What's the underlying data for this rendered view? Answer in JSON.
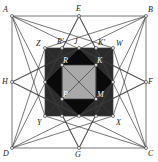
{
  "figure": {
    "type": "geometric-diagram",
    "canvas": {
      "width": 158,
      "height": 162
    },
    "colors": {
      "background": "#ffffff",
      "stroke": "#3c3c3c",
      "outer_square_fill": "#ffffff",
      "mid_square_fill": "#2b2b2b",
      "rotated_square_fill": "#0a0a0a",
      "inner_square_fill": "#a9a9a9",
      "node_fill": "#ffffff",
      "label": "#1a1a1a",
      "label_on_dark": "#ffffff"
    },
    "outer_square": {
      "name": "ABCD",
      "corners": [
        {
          "id": "A",
          "label": "A",
          "x": 12,
          "y": 16,
          "label_x": 3,
          "label_y": 6
        },
        {
          "id": "B",
          "label": "B",
          "x": 146,
          "y": 16,
          "label_x": 148,
          "label_y": 6
        },
        {
          "id": "C",
          "label": "C",
          "x": 146,
          "y": 148,
          "label_x": 148,
          "label_y": 150
        },
        {
          "id": "D",
          "label": "D",
          "x": 12,
          "y": 148,
          "label_x": 3,
          "label_y": 150
        }
      ],
      "midpoints": [
        {
          "id": "E",
          "label": "E",
          "x": 79,
          "y": 16,
          "label_x": 76,
          "label_y": 5
        },
        {
          "id": "F",
          "label": "F",
          "x": 146,
          "y": 82,
          "label_x": 148,
          "label_y": 78
        },
        {
          "id": "G",
          "label": "G",
          "x": 79,
          "y": 148,
          "label_x": 75,
          "label_y": 151
        },
        {
          "id": "H",
          "label": "H",
          "x": 12,
          "y": 82,
          "label_x": 2,
          "label_y": 78
        }
      ]
    },
    "mid_square": {
      "name": "ZWXY",
      "corners": [
        {
          "id": "Z",
          "label": "Z",
          "x": 45,
          "y": 48,
          "label_x": 36,
          "label_y": 40
        },
        {
          "id": "W",
          "label": "W",
          "x": 113,
          "y": 48,
          "label_x": 116,
          "label_y": 40
        },
        {
          "id": "X",
          "label": "X",
          "x": 113,
          "y": 116,
          "label_x": 116,
          "label_y": 119
        },
        {
          "id": "Y",
          "label": "Y",
          "x": 45,
          "y": 116,
          "label_x": 37,
          "label_y": 119
        }
      ],
      "midpoints": [
        {
          "id": "J",
          "label": "J",
          "x": 79,
          "y": 48,
          "label_x": 74,
          "label_y": 38
        },
        {
          "id": "Rp",
          "label": "R'",
          "x": 62,
          "y": 48,
          "label_x": 57,
          "label_y": 38
        },
        {
          "id": "Kp",
          "label": "K'",
          "x": 96,
          "y": 48,
          "label_x": 98,
          "label_y": 39
        }
      ]
    },
    "inner_square": {
      "name": "RKMP",
      "corners": [
        {
          "id": "R",
          "label": "R",
          "x": 62,
          "y": 65,
          "label_x": 63,
          "label_y": 58
        },
        {
          "id": "K",
          "label": "K",
          "x": 96,
          "y": 65,
          "label_x": 97,
          "label_y": 58
        },
        {
          "id": "M",
          "label": "M",
          "x": 96,
          "y": 99,
          "label_x": 97,
          "label_y": 92
        },
        {
          "id": "P",
          "label": "P",
          "x": 62,
          "y": 99,
          "label_x": 63,
          "label_y": 92
        }
      ]
    },
    "rotated_square": {
      "name": "inscribed-diamond",
      "vertices": [
        {
          "x": 79,
          "y": 48
        },
        {
          "x": 113,
          "y": 82
        },
        {
          "x": 79,
          "y": 116
        },
        {
          "x": 45,
          "y": 82
        }
      ]
    },
    "node_points": [
      {
        "x": 12,
        "y": 16
      },
      {
        "x": 79,
        "y": 16
      },
      {
        "x": 146,
        "y": 16
      },
      {
        "x": 12,
        "y": 82
      },
      {
        "x": 146,
        "y": 82
      },
      {
        "x": 12,
        "y": 148
      },
      {
        "x": 79,
        "y": 148
      },
      {
        "x": 146,
        "y": 148
      },
      {
        "x": 45,
        "y": 48
      },
      {
        "x": 62,
        "y": 48
      },
      {
        "x": 79,
        "y": 48
      },
      {
        "x": 96,
        "y": 48
      },
      {
        "x": 113,
        "y": 48
      },
      {
        "x": 45,
        "y": 82
      },
      {
        "x": 113,
        "y": 82
      },
      {
        "x": 45,
        "y": 116
      },
      {
        "x": 62,
        "y": 116
      },
      {
        "x": 79,
        "y": 116
      },
      {
        "x": 96,
        "y": 116
      },
      {
        "x": 113,
        "y": 116
      },
      {
        "x": 62,
        "y": 65
      },
      {
        "x": 96,
        "y": 65
      },
      {
        "x": 62,
        "y": 99
      },
      {
        "x": 96,
        "y": 99
      }
    ],
    "star_segments": [
      [
        12,
        16,
        146,
        16
      ],
      [
        146,
        16,
        146,
        148
      ],
      [
        146,
        148,
        12,
        148
      ],
      [
        12,
        148,
        12,
        16
      ],
      [
        12,
        16,
        79,
        148
      ],
      [
        79,
        148,
        146,
        16
      ],
      [
        146,
        16,
        12,
        82
      ],
      [
        12,
        82,
        146,
        148
      ],
      [
        146,
        148,
        79,
        16
      ],
      [
        79,
        16,
        12,
        148
      ],
      [
        12,
        148,
        146,
        82
      ],
      [
        146,
        82,
        12,
        16
      ],
      [
        12,
        16,
        113,
        48
      ],
      [
        12,
        16,
        45,
        116
      ],
      [
        146,
        16,
        45,
        48
      ],
      [
        146,
        16,
        113,
        116
      ],
      [
        146,
        148,
        113,
        48
      ],
      [
        146,
        148,
        45,
        116
      ],
      [
        12,
        148,
        45,
        48
      ],
      [
        12,
        148,
        113,
        116
      ],
      [
        79,
        16,
        45,
        82
      ],
      [
        79,
        16,
        113,
        82
      ],
      [
        79,
        148,
        45,
        82
      ],
      [
        79,
        148,
        113,
        82
      ],
      [
        12,
        82,
        79,
        48
      ],
      [
        12,
        82,
        79,
        116
      ],
      [
        146,
        82,
        79,
        48
      ],
      [
        146,
        82,
        79,
        116
      ],
      [
        45,
        48,
        113,
        48
      ],
      [
        113,
        48,
        113,
        116
      ],
      [
        113,
        116,
        45,
        116
      ],
      [
        45,
        116,
        45,
        48
      ],
      [
        79,
        48,
        113,
        82
      ],
      [
        113,
        82,
        79,
        116
      ],
      [
        79,
        116,
        45,
        82
      ],
      [
        45,
        82,
        79,
        48
      ],
      [
        62,
        65,
        96,
        65
      ],
      [
        96,
        65,
        96,
        99
      ],
      [
        96,
        99,
        62,
        99
      ],
      [
        62,
        99,
        62,
        65
      ],
      [
        62,
        48,
        62,
        116
      ],
      [
        96,
        48,
        96,
        116
      ],
      [
        45,
        48,
        113,
        116
      ],
      [
        113,
        48,
        45,
        116
      ]
    ]
  }
}
